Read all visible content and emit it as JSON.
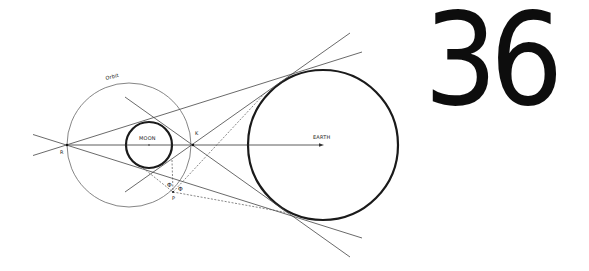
{
  "chapter": {
    "number": "36"
  },
  "diagram": {
    "labels": {
      "orbit": "Orbit",
      "moon": "MOON",
      "earth": "EARTH",
      "point_r": "R",
      "point_k": "K",
      "point_p": "P",
      "angle_1": "Φ",
      "angle_2": "Φ"
    },
    "colors": {
      "ink": "#1a1a1a",
      "thin_line": "#555555",
      "background": "#ffffff"
    }
  }
}
